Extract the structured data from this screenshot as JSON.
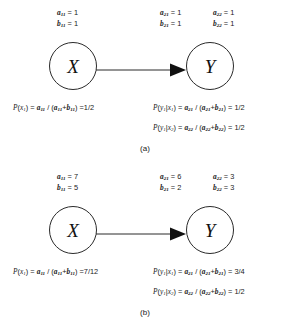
{
  "figure": {
    "panels": [
      {
        "id": "a",
        "caption": "(a)",
        "nodes": {
          "source": "X",
          "target": "Y"
        },
        "params": {
          "x": {
            "a_label": "a",
            "a_sub": "11",
            "a_value": "1",
            "b_label": "b",
            "b_sub": "11",
            "b_value": "1"
          },
          "y1": {
            "a_label": "a",
            "a_sub": "21",
            "a_value": "1",
            "b_label": "b",
            "b_sub": "21",
            "b_value": "1"
          },
          "y2": {
            "a_label": "a",
            "a_sub": "22",
            "a_value": "1",
            "b_label": "b",
            "b_sub": "22",
            "b_value": "1"
          }
        },
        "formulas": {
          "px": {
            "lhs": "P(x",
            "lhs_sub": "1",
            "result": "1/2"
          },
          "py1": {
            "result": "1/2"
          },
          "py2": {
            "result": "1/2"
          }
        }
      },
      {
        "id": "b",
        "caption": "(b)",
        "nodes": {
          "source": "X",
          "target": "Y"
        },
        "params": {
          "x": {
            "a_label": "a",
            "a_sub": "11",
            "a_value": "7",
            "b_label": "b",
            "b_sub": "11",
            "b_value": "5"
          },
          "y1": {
            "a_label": "a",
            "a_sub": "21",
            "a_value": "6",
            "b_label": "b",
            "b_sub": "21",
            "b_value": "2"
          },
          "y2": {
            "a_label": "a",
            "a_sub": "22",
            "a_value": "3",
            "b_label": "b",
            "b_sub": "22",
            "b_value": "3"
          }
        },
        "formulas": {
          "px": {
            "lhs": "P(x",
            "lhs_sub": "1",
            "result": "7/12"
          },
          "py1": {
            "result": "3/4"
          },
          "py2": {
            "result": "1/2"
          }
        }
      }
    ],
    "colors": {
      "stroke": "#2b2b2b",
      "text": "#1a1a1a",
      "background": "#ffffff"
    }
  }
}
